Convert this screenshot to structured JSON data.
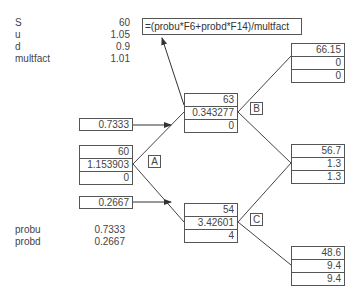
{
  "parameters": [
    {
      "label": "S",
      "value": "60"
    },
    {
      "label": "u",
      "value": "1.05"
    },
    {
      "label": "d",
      "value": "0.9"
    },
    {
      "label": "multfact",
      "value": "1.01"
    }
  ],
  "probabilities": [
    {
      "label": "probu",
      "value": "0.7333"
    },
    {
      "label": "probd",
      "value": "0.2667"
    }
  ],
  "formula": "=(probu*F6+probd*F14)/multfact",
  "branch_probs": {
    "up": "0.7333",
    "down": "0.2667"
  },
  "nodes": {
    "A": {
      "tag": "A",
      "rows": [
        "60",
        "1.153903",
        "0"
      ]
    },
    "B": {
      "tag": "B",
      "rows": [
        "63",
        "0.343277",
        "0"
      ]
    },
    "C": {
      "tag": "C",
      "rows": [
        "54",
        "3.42601",
        "4"
      ]
    },
    "UU": {
      "rows": [
        "66.15",
        "0",
        "0"
      ]
    },
    "UD": {
      "rows": [
        "56.7",
        "1.3",
        "1.3"
      ]
    },
    "DD": {
      "rows": [
        "48.6",
        "9.4",
        "9.4"
      ]
    }
  }
}
